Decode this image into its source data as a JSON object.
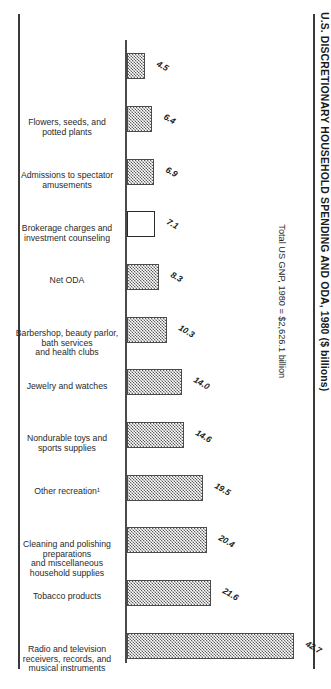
{
  "chart_data": {
    "type": "bar",
    "title": "U.S. DISCRETIONARY HOUSEHOLD SPENDING AND ODA, 1980 ($ billions)",
    "xlabel": "",
    "ylabel": "",
    "ylim": [
      0,
      45
    ],
    "grid": false,
    "legend": "none",
    "annotation": "Total US GNP, 1980  =  $2,626.1 billion",
    "highlight_category": "Net ODA",
    "categories": [
      "Flowers, seeds, and potted plants",
      "Admissions to spectator amusements",
      "Brokerage charges and investment counseling",
      "Net ODA",
      "Barbershop, beauty parlor, bath services and health clubs",
      "Jewelry and watches",
      "Nondurable toys and sports supplies",
      "Other recreation¹",
      "Cleaning and polishing preparations and miscellaneous household supplies",
      "Tobacco products",
      "Radio and television receivers, records, and musical instruments",
      "Alcoholic beverages"
    ],
    "values": [
      4.5,
      6.4,
      6.9,
      7.1,
      8.3,
      10.3,
      14.0,
      14.6,
      19.5,
      20.4,
      21.6,
      42.7
    ],
    "value_labels": [
      "4.5",
      "6.4",
      "6.9",
      "7.1",
      "8.3",
      "10.3",
      "14.0",
      "14.6",
      "19.5",
      "20.4",
      "21.6",
      "42.7"
    ]
  }
}
